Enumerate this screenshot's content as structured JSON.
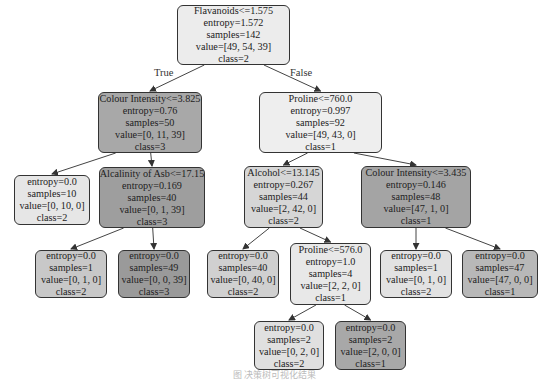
{
  "edge_labels": {
    "true": "True",
    "false": "False"
  },
  "nodes": [
    {
      "id": "n0",
      "lines": [
        "Flavanoids<=1.575",
        "entropy=1.572",
        "samples=142",
        "value=[49, 54, 39]",
        "class=2"
      ],
      "x": 177,
      "y": 5,
      "w": 113,
      "h": 60,
      "fill": "#ececec"
    },
    {
      "id": "n1",
      "lines": [
        "Colour Intensity<=3.825",
        "entropy=0.76",
        "samples=50",
        "value=[0, 11, 39]",
        "class=3"
      ],
      "x": 98,
      "y": 92,
      "w": 104,
      "h": 61,
      "fill": "#a8a8a8"
    },
    {
      "id": "n2",
      "lines": [
        "Proline<=760.0",
        "entropy=0.997",
        "samples=92",
        "value=[49, 43, 0]",
        "class=1"
      ],
      "x": 259,
      "y": 92,
      "w": 123,
      "h": 61,
      "fill": "#eeeeee"
    },
    {
      "id": "n3",
      "lines": [
        "entropy=0.0",
        "samples=10",
        "value=[0, 10, 0]",
        "class=2"
      ],
      "x": 14,
      "y": 175,
      "w": 76,
      "h": 50,
      "fill": "#e6e6e6"
    },
    {
      "id": "n4",
      "lines": [
        "Alcalinity of Asb<=17.15",
        "entropy=0.169",
        "samples=40",
        "value=[0, 1, 39]",
        "class=3"
      ],
      "x": 99,
      "y": 167,
      "w": 106,
      "h": 61,
      "fill": "#9e9e9e"
    },
    {
      "id": "n5",
      "lines": [
        "Alcohol<=13.145",
        "entropy=0.267",
        "samples=44",
        "value=[2, 42, 0]",
        "class=2"
      ],
      "x": 244,
      "y": 166,
      "w": 79,
      "h": 62,
      "fill": "#d6d6d6"
    },
    {
      "id": "n6",
      "lines": [
        "Colour Intensity<=3.435",
        "entropy=0.146",
        "samples=48",
        "value=[47, 1, 0]",
        "class=1"
      ],
      "x": 361,
      "y": 166,
      "w": 110,
      "h": 62,
      "fill": "#a4a4a4"
    },
    {
      "id": "n7",
      "lines": [
        "entropy=0.0",
        "samples=1",
        "value=[0, 1, 0]",
        "class=2"
      ],
      "x": 35,
      "y": 250,
      "w": 72,
      "h": 48,
      "fill": "#c8c8c8"
    },
    {
      "id": "n8",
      "lines": [
        "entropy=0.0",
        "samples=49",
        "value=[0, 0, 39]",
        "class=3"
      ],
      "x": 118,
      "y": 250,
      "w": 72,
      "h": 48,
      "fill": "#9a9a9a"
    },
    {
      "id": "n9",
      "lines": [
        "entropy=0.0",
        "samples=40",
        "value=[0, 40, 0]",
        "class=2"
      ],
      "x": 207,
      "y": 250,
      "w": 72,
      "h": 48,
      "fill": "#d0d0d0"
    },
    {
      "id": "n10",
      "lines": [
        "Proline<=576.0",
        "entropy=1.0",
        "samples=4",
        "value=[2, 2, 0]",
        "class=1"
      ],
      "x": 290,
      "y": 243,
      "w": 81,
      "h": 62,
      "fill": "#e8e8e8"
    },
    {
      "id": "n11",
      "lines": [
        "entropy=0.0",
        "samples=1",
        "value=[0, 1, 0]",
        "class=2"
      ],
      "x": 380,
      "y": 250,
      "w": 72,
      "h": 48,
      "fill": "#e2e2e2"
    },
    {
      "id": "n12",
      "lines": [
        "entropy=0.0",
        "samples=47",
        "value=[47, 0, 0]",
        "class=1"
      ],
      "x": 462,
      "y": 250,
      "w": 76,
      "h": 48,
      "fill": "#b8b8b8"
    },
    {
      "id": "n13",
      "lines": [
        "entropy=0.0",
        "samples=2",
        "value=[0, 2, 0]",
        "class=2"
      ],
      "x": 254,
      "y": 321,
      "w": 70,
      "h": 49,
      "fill": "#e0e0e0"
    },
    {
      "id": "n14",
      "lines": [
        "entropy=0.0",
        "samples=2",
        "value=[2, 0, 0]",
        "class=1"
      ],
      "x": 335,
      "y": 321,
      "w": 71,
      "h": 49,
      "fill": "#a8a8a8"
    }
  ],
  "edges": [
    [
      "n0",
      "n1"
    ],
    [
      "n0",
      "n2"
    ],
    [
      "n1",
      "n3"
    ],
    [
      "n1",
      "n4"
    ],
    [
      "n2",
      "n5"
    ],
    [
      "n2",
      "n6"
    ],
    [
      "n4",
      "n7"
    ],
    [
      "n4",
      "n8"
    ],
    [
      "n5",
      "n9"
    ],
    [
      "n5",
      "n10"
    ],
    [
      "n6",
      "n11"
    ],
    [
      "n6",
      "n12"
    ],
    [
      "n10",
      "n13"
    ],
    [
      "n10",
      "n14"
    ]
  ],
  "caption": "图 决策树可视化结果"
}
